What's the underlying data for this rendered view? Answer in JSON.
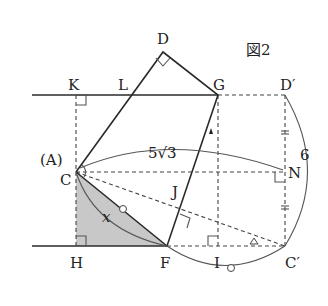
{
  "figure": {
    "title": "図2"
  },
  "labels": {
    "D": "D",
    "G": "G",
    "D_prime": "D′",
    "K": "K",
    "L": "L",
    "A_paren": "(A)",
    "C": "C",
    "J": "J",
    "N": "N",
    "H": "H",
    "F": "F",
    "I": "I",
    "C_prime": "C′",
    "x": "x",
    "length_CN": "5√3",
    "length_arc": "6"
  },
  "colors": {
    "shade": "#c8c8c8",
    "line": "#2a2a2a"
  }
}
